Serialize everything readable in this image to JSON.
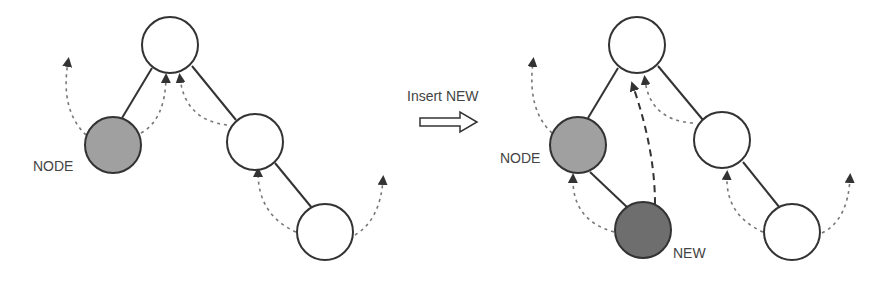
{
  "diagram": {
    "colors": {
      "node_fill": "#ffffff",
      "node_stroke": "#333333",
      "highlight_fill": "#a0a0a0",
      "new_fill": "#6e6e6e",
      "edge": "#333333",
      "arrow": "#555555"
    },
    "before": {
      "labels": {
        "node": "NODE"
      }
    },
    "transition": {
      "label": "Insert NEW"
    },
    "after": {
      "labels": {
        "node": "NODE",
        "new": "NEW"
      }
    }
  }
}
